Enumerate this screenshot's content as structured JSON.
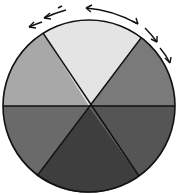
{
  "diagram": {
    "type": "segmented-circle",
    "segment_count": 6,
    "center": [
      89,
      106
    ],
    "radius": 86,
    "segments": [
      {
        "name": "top",
        "color": "#e4e4e4"
      },
      {
        "name": "upper-right",
        "color": "#7a7a7a"
      },
      {
        "name": "lower-right",
        "color": "#555555"
      },
      {
        "name": "bottom",
        "color": "#3e3e3e"
      },
      {
        "name": "lower-left",
        "color": "#6a6a6a"
      },
      {
        "name": "upper-left",
        "color": "#a8a8a8"
      }
    ],
    "outline_color": "#111111",
    "arrows": {
      "description": "curved arrows around the top rim indicating rotation",
      "color": "#111111"
    }
  }
}
